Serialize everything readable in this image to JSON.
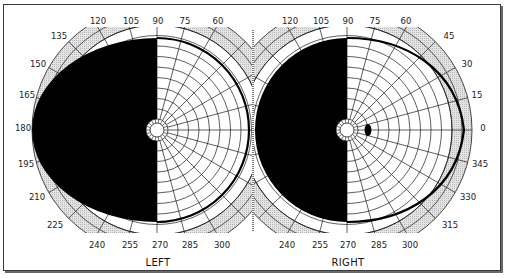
{
  "colors": {
    "frame": "#3a3a3a",
    "ring_fill": "#d6d6d6",
    "grid": "#1a1a1a",
    "field_loss": "#000000",
    "background": "#ffffff"
  },
  "charts": [
    {
      "id": "left",
      "label": "LEFT",
      "center": [
        157,
        130
      ],
      "meridian_labels": [
        "90",
        "105",
        "120",
        "135",
        "150",
        "165",
        "180",
        "195",
        "210",
        "225",
        "240",
        "255",
        "270",
        "285",
        "300"
      ],
      "meridian_label_positions": [
        {
          "deg": "120",
          "x": 98,
          "y": 24
        },
        {
          "deg": "105",
          "x": 131,
          "y": 24
        },
        {
          "deg": "90",
          "x": 158,
          "y": 24
        },
        {
          "deg": "75",
          "x": 185,
          "y": 24
        },
        {
          "deg": "60",
          "x": 218,
          "y": 24
        },
        {
          "deg": "135",
          "x": 59,
          "y": 39
        },
        {
          "deg": "150",
          "x": 38,
          "y": 67
        },
        {
          "deg": "165",
          "x": 27,
          "y": 98
        },
        {
          "deg": "180",
          "x": 23,
          "y": 131
        },
        {
          "deg": "195",
          "x": 26,
          "y": 167
        },
        {
          "deg": "210",
          "x": 37,
          "y": 200
        },
        {
          "deg": "225",
          "x": 55,
          "y": 228
        },
        {
          "deg": "240",
          "x": 97,
          "y": 248
        },
        {
          "deg": "255",
          "x": 130,
          "y": 248
        },
        {
          "deg": "270",
          "x": 160,
          "y": 248
        },
        {
          "deg": "285",
          "x": 190,
          "y": 248
        },
        {
          "deg": "300",
          "x": 222,
          "y": 248
        }
      ],
      "defect": "temporal (left) hemifield completely blind",
      "blind_spot": false
    },
    {
      "id": "right",
      "label": "RIGHT",
      "center": [
        347,
        130
      ],
      "meridian_label_positions": [
        {
          "deg": "120",
          "x": 290,
          "y": 24
        },
        {
          "deg": "105",
          "x": 321,
          "y": 24
        },
        {
          "deg": "90",
          "x": 348,
          "y": 24
        },
        {
          "deg": "75",
          "x": 375,
          "y": 24
        },
        {
          "deg": "60",
          "x": 406,
          "y": 24
        },
        {
          "deg": "45",
          "x": 449,
          "y": 39
        },
        {
          "deg": "30",
          "x": 467,
          "y": 67
        },
        {
          "deg": "15",
          "x": 477,
          "y": 98
        },
        {
          "deg": "0",
          "x": 483,
          "y": 131
        },
        {
          "deg": "345",
          "x": 480,
          "y": 167
        },
        {
          "deg": "330",
          "x": 468,
          "y": 200
        },
        {
          "deg": "315",
          "x": 450,
          "y": 228
        },
        {
          "deg": "240",
          "x": 287,
          "y": 248
        },
        {
          "deg": "255",
          "x": 320,
          "y": 248
        },
        {
          "deg": "270",
          "x": 348,
          "y": 248
        },
        {
          "deg": "285",
          "x": 379,
          "y": 248
        },
        {
          "deg": "300",
          "x": 410,
          "y": 248
        }
      ],
      "defect": "nasal (left) hemifield completely blind",
      "blind_spot": true
    }
  ],
  "geometry": {
    "outer_radius": 125,
    "grid_radius": 105,
    "fovea_radius": 7,
    "fovea_ring_radius": 11,
    "ring_count": 10,
    "meridian_step_deg": 15,
    "clip_top": 27,
    "clip_bottom": 233
  }
}
